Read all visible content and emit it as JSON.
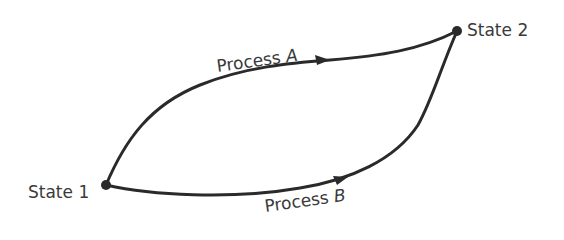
{
  "diagram": {
    "type": "thermodynamic process paths",
    "states": [
      {
        "id": "state1",
        "label": "State 1",
        "x": 106,
        "y": 185
      },
      {
        "id": "state2",
        "label": "State 2",
        "x": 457,
        "y": 31
      }
    ],
    "processes": [
      {
        "id": "processA",
        "label_prefix": "Process",
        "label_var": "A",
        "from": "state1",
        "to": "state2",
        "path": "upper curve"
      },
      {
        "id": "processB",
        "label_prefix": "Process",
        "label_var": "B",
        "from": "state1",
        "to": "state2",
        "path": "lower curve"
      }
    ],
    "colors": {
      "line": "#2a2a2a",
      "text": "#3a3a3a",
      "background": "#ffffff"
    }
  }
}
